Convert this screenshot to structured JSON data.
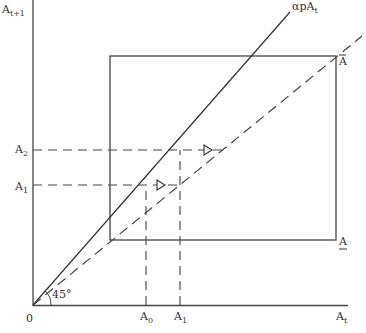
{
  "diagram": {
    "axes": {
      "y_label": "A",
      "y_label_sub": "t+1",
      "x_label": "A",
      "x_label_sub": "t",
      "origin_label": "0"
    },
    "lines": {
      "solid_line_label_main": "αpA",
      "solid_line_label_sub": "t",
      "angle_label": "45°"
    },
    "box": {
      "upper_label": "A",
      "upper_label_mark": "overbar",
      "lower_label": "A",
      "lower_label_mark": "underbar"
    },
    "y_ticks": [
      {
        "main": "A",
        "sub": "2"
      },
      {
        "main": "A",
        "sub": "1"
      }
    ],
    "x_ticks": [
      {
        "main": "A",
        "sub": "0"
      },
      {
        "main": "A",
        "sub": "1"
      }
    ],
    "colors": {
      "line": "#333333",
      "background": "#ffffff"
    }
  }
}
